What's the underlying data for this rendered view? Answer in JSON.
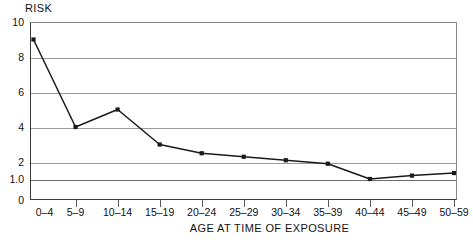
{
  "chart_data": {
    "type": "line",
    "title": "",
    "ylabel": "RISK",
    "xlabel": "AGE AT TIME OF EXPOSURE",
    "categories": [
      "0–4",
      "5–9",
      "10–14",
      "15–19",
      "20–24",
      "25–29",
      "30–34",
      "35–39",
      "40–44",
      "45–49",
      "50–59"
    ],
    "values": [
      9.0,
      4.0,
      5.0,
      3.0,
      2.5,
      2.3,
      2.1,
      1.9,
      1.0,
      1.2,
      1.35
    ],
    "ytick_labels": [
      "10",
      "8",
      "6",
      "4",
      "2",
      "1.0",
      "0"
    ],
    "ytick_values": [
      10,
      8,
      6,
      4,
      2,
      1.0,
      0
    ],
    "ylim": [
      0,
      10
    ],
    "grid": true,
    "legend": "none",
    "marker": "filled-square",
    "line_color": "#1a1a1a",
    "grid_color": "#9a9a9a",
    "axis_color": "#3a3a3a",
    "background": "#ffffff"
  },
  "figure": {
    "y_axis_title": "RISK",
    "x_axis_title": "AGE AT TIME OF EXPOSURE"
  }
}
